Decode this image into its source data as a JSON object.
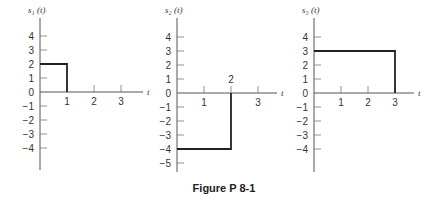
{
  "figure": {
    "caption": "Figure P 8-1"
  },
  "chart_data": [
    {
      "type": "line",
      "title": "s1 (t)",
      "ylabel": "s₁ (t)",
      "xlabel": "t",
      "x_ticks": [
        1,
        2,
        3
      ],
      "y_ticks": [
        4,
        3,
        2,
        1,
        0,
        -1,
        -2,
        -3,
        -4
      ],
      "ylim": [
        -6,
        5
      ],
      "xlim": [
        0,
        3.6
      ],
      "grid": false,
      "series": [
        {
          "name": "s1",
          "x": [
            0,
            1,
            1
          ],
          "y": [
            2,
            2,
            0
          ]
        }
      ],
      "description": "Rectangular pulse of amplitude 2 from t=0 to t=1"
    },
    {
      "type": "line",
      "title": "s2 (t)",
      "ylabel": "s₂ (t)",
      "xlabel": "t",
      "x_ticks": [
        1,
        2,
        3
      ],
      "y_ticks": [
        4,
        3,
        2,
        1,
        0,
        -1,
        -2,
        -3,
        -4,
        -5
      ],
      "ylim": [
        -5.5,
        5
      ],
      "xlim": [
        0,
        3.6
      ],
      "grid": false,
      "series": [
        {
          "name": "s2",
          "x": [
            0,
            2,
            2
          ],
          "y": [
            -4,
            -4,
            0
          ]
        }
      ],
      "description": "Rectangular pulse of amplitude -4 from t=0 to t=2"
    },
    {
      "type": "line",
      "title": "s3 (t)",
      "ylabel": "s₃ (t)",
      "xlabel": "t",
      "x_ticks": [
        1,
        2,
        3
      ],
      "y_ticks": [
        4,
        3,
        2,
        1,
        0,
        -1,
        -2,
        -3,
        -4
      ],
      "ylim": [
        -6,
        5
      ],
      "xlim": [
        0,
        3.6
      ],
      "grid": false,
      "series": [
        {
          "name": "s3",
          "x": [
            0,
            3,
            3
          ],
          "y": [
            3,
            3,
            0
          ]
        }
      ],
      "description": "Rectangular pulse of amplitude 3 from t=0 to t=3"
    }
  ],
  "plots": [
    {
      "ylabel": "s₁ (t)",
      "xlabel": "t"
    },
    {
      "ylabel": "s₂ (t)",
      "xlabel": "t"
    },
    {
      "ylabel": "s₃ (t)",
      "xlabel": "t"
    }
  ]
}
